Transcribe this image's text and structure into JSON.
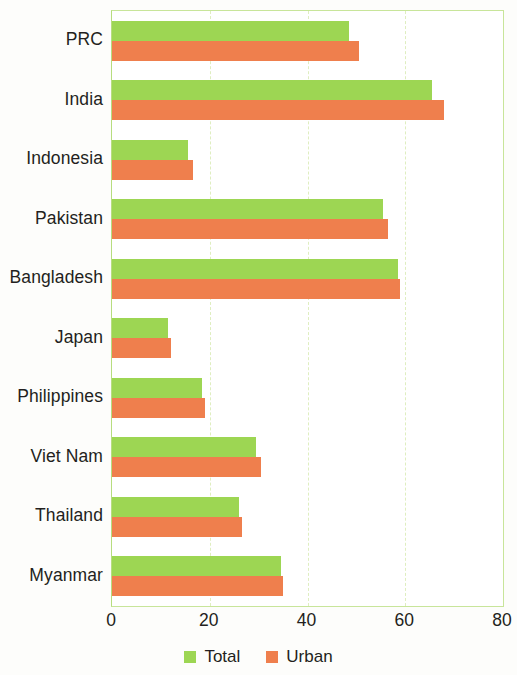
{
  "chart_data": {
    "type": "bar",
    "orientation": "horizontal",
    "title": "",
    "subtitle": "",
    "xlabel": "",
    "ylabel": "",
    "xlim": [
      0,
      80
    ],
    "xticks": [
      "0",
      "20",
      "40",
      "60",
      "80"
    ],
    "xtick_values": [
      0,
      20,
      40,
      60,
      80
    ],
    "grid": true,
    "grid_axis": "x",
    "legend_position": "bottom-center",
    "categories": [
      "PRC",
      "India",
      "Indonesia",
      "Pakistan",
      "Bangladesh",
      "Japan",
      "Philippines",
      "Viet Nam",
      "Thailand",
      "Myanmar"
    ],
    "series": [
      {
        "name": "Total",
        "color": "#9dd653",
        "values": [
          48.5,
          65.5,
          15.5,
          55.5,
          58.5,
          11.5,
          18.5,
          29.5,
          26.0,
          34.5
        ]
      },
      {
        "name": "Urban",
        "color": "#ef7f4d",
        "values": [
          50.5,
          68.0,
          16.5,
          56.5,
          59.0,
          12.0,
          19.0,
          30.5,
          26.5,
          35.0
        ]
      }
    ],
    "legend": [
      {
        "label": "Total",
        "color": "#9dd653"
      },
      {
        "label": "Urban",
        "color": "#ef7f4d"
      }
    ]
  },
  "colors": {
    "total": "#9dd653",
    "urban": "#ef7f4d",
    "axis": "#b7dd7f",
    "gridline": "#dfeec0",
    "text": "#231f20"
  }
}
